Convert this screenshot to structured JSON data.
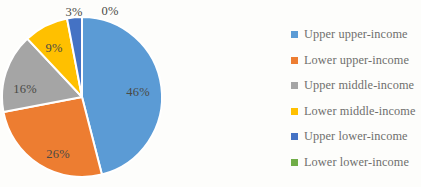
{
  "chart_data": {
    "type": "pie",
    "title": "",
    "subtitle": "",
    "xlabel": "",
    "ylabel": "",
    "grid": false,
    "legend_position": "right",
    "start_angle_deg": 0,
    "direction": "clockwise",
    "categories": [
      "Upper upper-income",
      "Lower upper-income",
      "Upper middle-income",
      "Lower middle-income",
      "Upper lower-income",
      "Lower lower-income"
    ],
    "values": [
      46,
      26,
      16,
      9,
      3,
      0
    ],
    "data_labels": [
      "46%",
      "26%",
      "16%",
      "9%",
      "3%",
      "0%"
    ],
    "colors": [
      "#5B9BD5",
      "#ED7D31",
      "#A5A5A5",
      "#FFC000",
      "#4472C4",
      "#70AD47"
    ],
    "slices": [
      {
        "label": "Upper upper-income",
        "value": 46,
        "data_label": "46%",
        "color": "#5B9BD5"
      },
      {
        "label": "Lower upper-income",
        "value": 26,
        "data_label": "26%",
        "color": "#ED7D31"
      },
      {
        "label": "Upper middle-income",
        "value": 16,
        "data_label": "16%",
        "color": "#A5A5A5"
      },
      {
        "label": "Lower middle-income",
        "value": 9,
        "data_label": "9%",
        "color": "#FFC000"
      },
      {
        "label": "Upper lower-income",
        "value": 3,
        "data_label": "3%",
        "color": "#4472C4"
      },
      {
        "label": "Lower lower-income",
        "value": 0,
        "data_label": "0%",
        "color": "#70AD47"
      }
    ]
  },
  "legend": {
    "items": [
      {
        "label": "Upper upper-income",
        "color": "#5B9BD5"
      },
      {
        "label": "Lower upper-income",
        "color": "#ED7D31"
      },
      {
        "label": "Upper middle-income",
        "color": "#A5A5A5"
      },
      {
        "label": "Lower middle-income",
        "color": "#FFC000"
      },
      {
        "label": "Upper lower-income",
        "color": "#4472C4"
      },
      {
        "label": "Lower lower-income",
        "color": "#70AD47"
      }
    ]
  },
  "labels": {
    "pct_upper_upper": "46%",
    "pct_lower_upper": "26%",
    "pct_upper_middle": "16%",
    "pct_lower_middle": "9%",
    "pct_upper_lower": "3%",
    "pct_lower_lower": "0%"
  },
  "style": {
    "background": "#fdfdfb",
    "label_text_color": "#4a4a46",
    "legend_text_color": "#6f6f6d",
    "slice_separator_color": "#ffffff"
  },
  "geometry": {
    "center_x": 82,
    "center_y": 97,
    "radius": 80
  }
}
